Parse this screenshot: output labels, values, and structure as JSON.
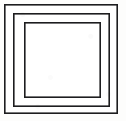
{
  "figure": {
    "canvas": {
      "width": 126,
      "height": 121,
      "background_color": "#fdfdfc"
    },
    "stroke_color": "#1d1d1f",
    "fill_color": "#ffffff",
    "shapes": [
      {
        "name": "outer-square",
        "order": 1,
        "x": 4,
        "y": 4,
        "width": 114,
        "height": 110,
        "stroke_width": 1.6
      },
      {
        "name": "middle-square",
        "order": 2,
        "x": 13,
        "y": 13,
        "width": 97,
        "height": 94,
        "stroke_width": 1.6
      },
      {
        "name": "inner-square",
        "order": 3,
        "x": 24,
        "y": 22,
        "width": 77,
        "height": 76,
        "stroke_width": 1.6
      }
    ],
    "shape_count": "3",
    "interior_label": ""
  }
}
